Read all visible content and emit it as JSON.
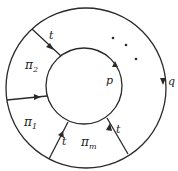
{
  "diagram": {
    "outer_circle": {
      "label": "q"
    },
    "inner_circle": {
      "label": "p"
    },
    "regions": [
      {
        "id": "pi2",
        "label": "π",
        "sub": "2"
      },
      {
        "id": "pi1",
        "label": "π",
        "sub": "1"
      },
      {
        "id": "pim",
        "label": "π",
        "sub": "m"
      }
    ],
    "edges": [
      {
        "label": "t"
      },
      {
        "label": ""
      },
      {
        "label": "t"
      },
      {
        "label": "t"
      }
    ],
    "ellipsis": "· · ·"
  },
  "colors": {
    "stroke": "#2a2a2a",
    "background": "#ffffff"
  }
}
